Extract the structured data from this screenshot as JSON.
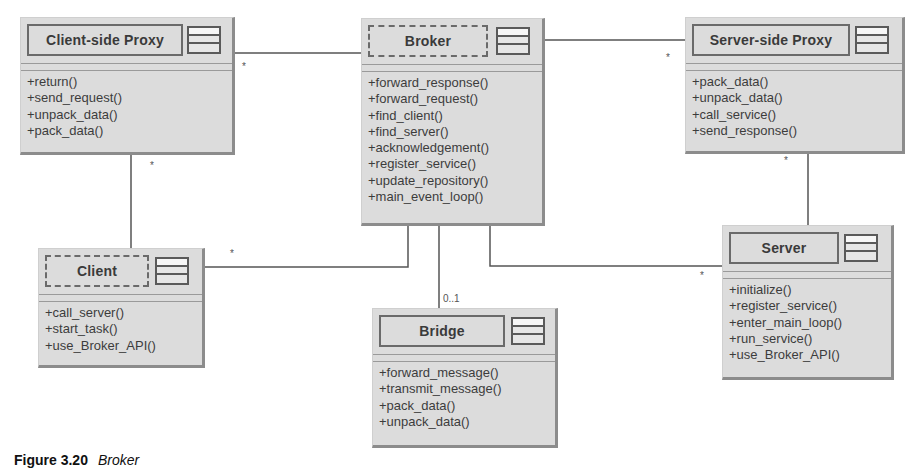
{
  "diagram": {
    "classes": [
      {
        "id": "client-side-proxy",
        "name": "Client-side Proxy",
        "stereotype_border": "solid",
        "operations": [
          "+return()",
          "+send_request()",
          "+unpack_data()",
          "+pack_data()"
        ]
      },
      {
        "id": "broker",
        "name": "Broker",
        "stereotype_border": "dashed",
        "operations": [
          "+forward_response()",
          "+forward_request()",
          "+find_client()",
          "+find_server()",
          "+acknowledgement()",
          "+register_service()",
          "+update_repository()",
          "+main_event_loop()"
        ]
      },
      {
        "id": "server-side-proxy",
        "name": "Server-side Proxy",
        "stereotype_border": "solid",
        "operations": [
          "+pack_data()",
          "+unpack_data()",
          "+call_service()",
          "+send_response()"
        ]
      },
      {
        "id": "client",
        "name": "Client",
        "stereotype_border": "dashed",
        "operations": [
          "+call_server()",
          "+start_task()",
          "+use_Broker_API()"
        ]
      },
      {
        "id": "bridge",
        "name": "Bridge",
        "stereotype_border": "solid",
        "operations": [
          "+forward_message()",
          "+transmit_message()",
          "+pack_data()",
          "+unpack_data()"
        ]
      },
      {
        "id": "server",
        "name": "Server",
        "stereotype_border": "solid",
        "operations": [
          "+initialize()",
          "+register_service()",
          "+enter_main_loop()",
          "+run_service()",
          "+use_Broker_API()"
        ]
      }
    ],
    "associations": [
      {
        "from": "Client-side Proxy",
        "to": "Broker",
        "multiplicity": "*"
      },
      {
        "from": "Broker",
        "to": "Server-side Proxy",
        "multiplicity": "*"
      },
      {
        "from": "Client-side Proxy",
        "to": "Client",
        "multiplicity": "*"
      },
      {
        "from": "Server-side Proxy",
        "to": "Server",
        "multiplicity": "*"
      },
      {
        "from": "Broker",
        "to": "Client",
        "multiplicity": "*"
      },
      {
        "from": "Broker",
        "to": "Bridge",
        "multiplicity": "0..1"
      },
      {
        "from": "Broker",
        "to": "Server",
        "multiplicity": "*"
      }
    ],
    "multiplicity_labels": {
      "csp_broker": "*",
      "broker_ssp": "*",
      "csp_client": "*",
      "ssp_server": "*",
      "broker_client": "*",
      "broker_bridge": "0..1",
      "broker_server": "*"
    }
  },
  "caption": {
    "label": "Figure 3.20",
    "title": "Broker"
  }
}
